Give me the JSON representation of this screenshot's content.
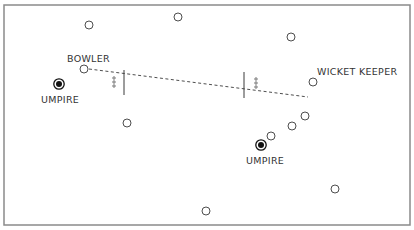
{
  "diagram": {
    "colors": {
      "border": "#8a8a8a",
      "ink": "#3a3a3a",
      "background": "#ffffff"
    },
    "border": {
      "x": 4,
      "y": 5,
      "width": 406,
      "height": 220
    },
    "labels": {
      "bowler": "BOWLER",
      "wicket_keeper": "WICKET KEEPER",
      "umpire_left": "UMPIRE",
      "umpire_right": "UMPIRE"
    },
    "label_positions": {
      "bowler": {
        "x": 67,
        "y": 62
      },
      "wicket_keeper": {
        "x": 317,
        "y": 75
      },
      "umpire_left": {
        "x": 41,
        "y": 103
      },
      "umpire_right": {
        "x": 246,
        "y": 164
      }
    },
    "pitch_line": {
      "x1": 89,
      "y1": 69,
      "x2": 308,
      "y2": 97
    },
    "wickets": [
      {
        "name": "bowler-end",
        "x": 124,
        "y1": 70,
        "y2": 95
      },
      {
        "name": "batsman-end",
        "x": 244,
        "y1": 72,
        "y2": 98
      }
    ],
    "batsman_marks": [
      {
        "x": 114,
        "ys": [
          78,
          82,
          86
        ]
      },
      {
        "x": 256,
        "ys": [
          79,
          83,
          87
        ]
      }
    ],
    "umpires": [
      {
        "name": "umpire-left",
        "x": 59,
        "y": 84
      },
      {
        "name": "umpire-right",
        "x": 261,
        "y": 145
      }
    ],
    "players": [
      {
        "name": "fielder",
        "x": 89,
        "y": 25
      },
      {
        "name": "fielder",
        "x": 178,
        "y": 17
      },
      {
        "name": "fielder",
        "x": 291,
        "y": 37
      },
      {
        "name": "bowler",
        "x": 84,
        "y": 69
      },
      {
        "name": "wicket-keeper",
        "x": 313,
        "y": 82
      },
      {
        "name": "fielder",
        "x": 127,
        "y": 123
      },
      {
        "name": "fielder",
        "x": 305,
        "y": 116
      },
      {
        "name": "fielder",
        "x": 292,
        "y": 126
      },
      {
        "name": "fielder",
        "x": 271,
        "y": 136
      },
      {
        "name": "fielder",
        "x": 335,
        "y": 189
      },
      {
        "name": "fielder",
        "x": 206,
        "y": 211
      }
    ]
  }
}
